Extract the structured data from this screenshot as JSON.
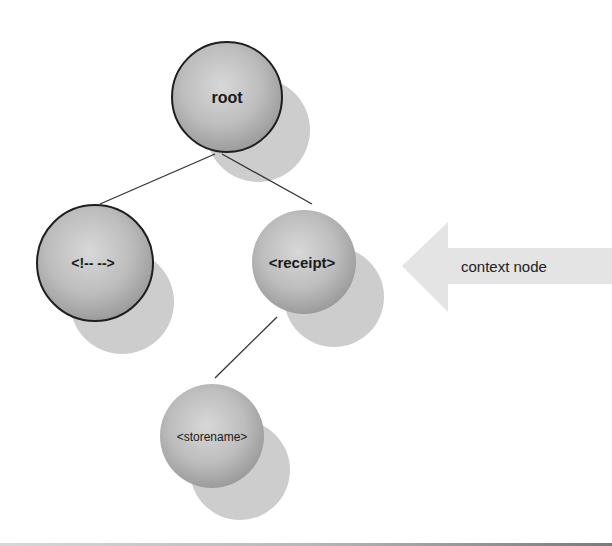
{
  "diagram": {
    "nodes": [
      {
        "id": "root",
        "label": "root",
        "bold": true,
        "outlined": true
      },
      {
        "id": "comment",
        "label": "<!-- -->",
        "bold": true,
        "outlined": true
      },
      {
        "id": "receipt",
        "label": "<receipt>",
        "bold": true,
        "outlined": false
      },
      {
        "id": "storename",
        "label": "<storename>",
        "bold": false,
        "outlined": false
      }
    ],
    "edges": [
      {
        "from": "root",
        "to": "comment"
      },
      {
        "from": "root",
        "to": "receipt"
      },
      {
        "from": "receipt",
        "to": "storename"
      }
    ],
    "pointer": {
      "label": "context node",
      "points_to": "receipt"
    }
  },
  "colors": {
    "node_fill_light": "#d6d6d6",
    "node_fill_dark": "#9a9a9a",
    "shadow": "#c8c8c8",
    "outline": "#1e1e1e",
    "arrow_fill": "#e6e6e6",
    "edge": "#333333"
  }
}
